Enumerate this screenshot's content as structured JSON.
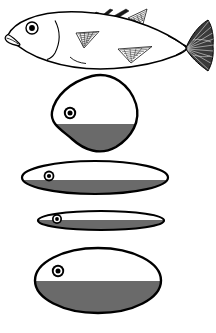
{
  "figure": {
    "title": "Fish body shapes with countershading",
    "background_color": "#ffffff",
    "outline_color": "#000000",
    "fill_light_color": "#ffffff",
    "fill_shadow_color": "#6a6a6a",
    "eye_pupil_color": "#000000",
    "eye_ring_color": "#ffffff",
    "width": 216,
    "height": 333
  },
  "panels": [
    {
      "id": "panel-fish",
      "name": "whole-fish-lateral-view",
      "label": "Stickleback lateral view",
      "shape_type": "fish-outline",
      "shaded": false,
      "eye": {
        "cx": 32,
        "cy": 28,
        "r_outer": 6.0,
        "r_ring": 4.2,
        "r_pupil": 2.6
      },
      "features": [
        "dorsal-spines",
        "pectoral-fin",
        "pelvic-fin",
        "anal-fin",
        "caudal-fin",
        "mouth",
        "gill-line"
      ]
    },
    {
      "id": "panel-diamond",
      "name": "diamond-cross-section",
      "label": "Deep-bodied kite profile",
      "shape_type": "kite",
      "shaded": true,
      "bounds": {
        "x": 50,
        "y": 75,
        "w": 88,
        "h": 76
      },
      "shadow_line_y": 124,
      "eye": {
        "cx": 70,
        "cy": 113,
        "r_outer": 6.2,
        "r_ring": 4.4,
        "r_pupil": 2.6
      }
    },
    {
      "id": "panel-ellipse-wide",
      "name": "wide-ellipse-cross-section",
      "label": "Fusiform profile",
      "shape_type": "ellipse",
      "shaded": true,
      "bounds": {
        "x": 22,
        "y": 161,
        "w": 146,
        "h": 33
      },
      "shadow_line_y": 180,
      "eye": {
        "cx": 49,
        "cy": 176,
        "r_outer": 5.4,
        "r_ring": 3.8,
        "r_pupil": 2.2
      }
    },
    {
      "id": "panel-ellipse-thin",
      "name": "thin-ellipse-cross-section",
      "label": "Slender profile",
      "shape_type": "ellipse",
      "shaded": true,
      "bounds": {
        "x": 38,
        "y": 211,
        "w": 126,
        "h": 19
      },
      "shadow_line_y": 220,
      "eye": {
        "cx": 57,
        "cy": 219,
        "r_outer": 5.0,
        "r_ring": 3.5,
        "r_pupil": 2.0
      }
    },
    {
      "id": "panel-ellipse-large",
      "name": "large-ellipse-cross-section",
      "label": "Oval deep profile",
      "shape_type": "ellipse",
      "shaded": true,
      "bounds": {
        "x": 35,
        "y": 248,
        "w": 126,
        "h": 65
      },
      "shadow_line_y": 281,
      "eye": {
        "cx": 58,
        "cy": 271,
        "r_outer": 6.2,
        "r_ring": 4.4,
        "r_pupil": 2.6
      }
    }
  ]
}
